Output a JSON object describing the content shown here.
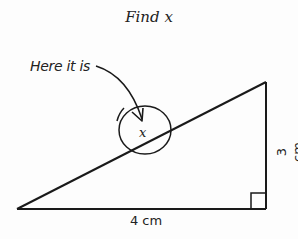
{
  "title": "Find x",
  "annotation": {
    "text": "Here it is",
    "icon": "curved-arrow-icon"
  },
  "triangle": {
    "variable_label": "x",
    "base_label": "4 cm",
    "height_label": "3 cm",
    "right_angle_marker": "right-angle-icon",
    "circle_marker": "circle-highlight-icon"
  },
  "colors": {
    "stroke": "#1a1a1a",
    "background": "#fdfdfd",
    "text": "#222222"
  }
}
